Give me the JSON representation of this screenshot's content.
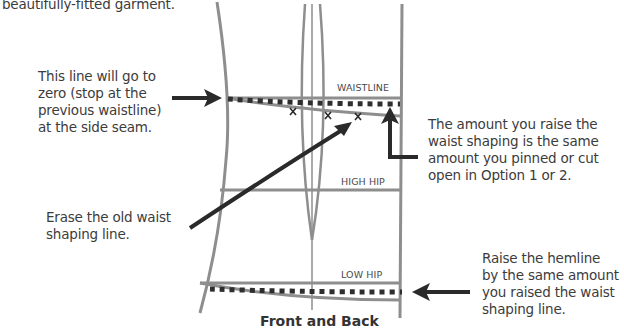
{
  "intro_fragment": "beautifully-fitted garment.",
  "annotations": {
    "side_seam_note": [
      "This line will go to",
      "zero (stop at the",
      "previous waistline)",
      "at the side seam."
    ],
    "erase_note": [
      "Erase the old waist",
      "shaping line."
    ],
    "raise_amount_note": [
      "The amount you raise the",
      "waist shaping is the same",
      "amount you pinned or cut",
      "open in Option 1 or 2."
    ],
    "hemline_note": [
      "Raise the hemline",
      "by the same amount",
      "you raised the waist",
      "shaping line."
    ]
  },
  "pattern_labels": {
    "waistline": "WAISTLINE",
    "high_hip": "HIGH HIP",
    "low_hip": "LOW HIP"
  },
  "marks": {
    "x_mark": "x"
  },
  "caption": "Front and Back",
  "colors": {
    "pattern_line": "#8e8e8e",
    "arrow": "#2a2a2a",
    "dotted_line": "#2e2e2e",
    "text": "#3c3c3c"
  }
}
